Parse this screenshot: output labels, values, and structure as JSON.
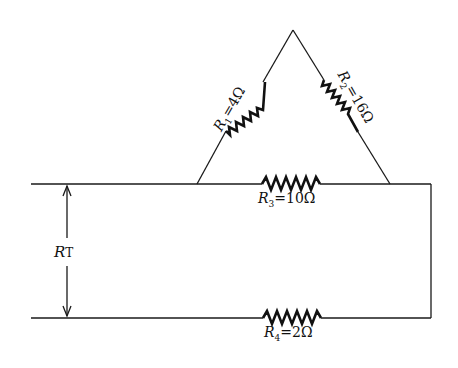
{
  "diagram": {
    "type": "circuit",
    "resistors": [
      {
        "id": "R1",
        "name": "R",
        "sub": "1",
        "value": "4Ω",
        "position": "left side of triangle"
      },
      {
        "id": "R2",
        "name": "R",
        "sub": "2",
        "value": "16Ω",
        "position": "right side of triangle"
      },
      {
        "id": "R3",
        "name": "R",
        "sub": "3",
        "value": "10Ω",
        "position": "top rail"
      },
      {
        "id": "R4",
        "name": "R",
        "sub": "4",
        "value": "2Ω",
        "position": "bottom rail"
      }
    ],
    "measurement": {
      "name": "R",
      "sub": "T",
      "label": "R_T"
    },
    "colors": {
      "line": "#1a1a1a",
      "background": "#ffffff"
    }
  }
}
